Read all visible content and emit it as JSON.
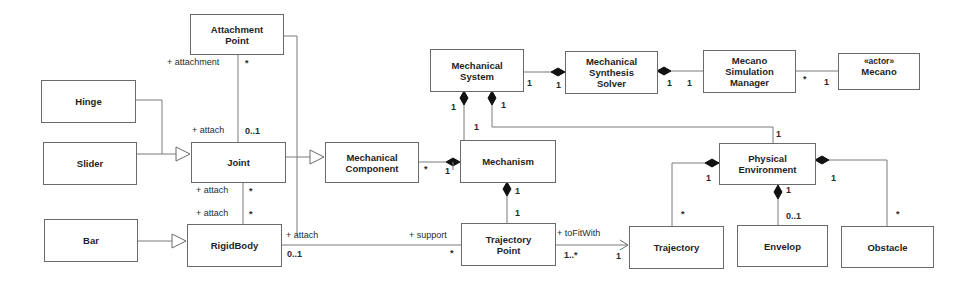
{
  "diagram": {
    "type": "UML class diagram",
    "classes": {
      "attachment_point": {
        "line1": "Attachment",
        "line2": "Point"
      },
      "hinge": {
        "name": "Hinge"
      },
      "slider": {
        "name": "Slider"
      },
      "joint": {
        "name": "Joint"
      },
      "bar": {
        "name": "Bar"
      },
      "rigid_body": {
        "name": "RigidBody"
      },
      "mechanical_component": {
        "line1": "Mechanical",
        "line2": "Component"
      },
      "mechanism": {
        "name": "Mechanism"
      },
      "mechanical_system": {
        "line1": "Mechanical",
        "line2": "System"
      },
      "synthesis_solver": {
        "line1": "Mechanical",
        "line2": "Synthesis",
        "line3": "Solver"
      },
      "simulation_manager": {
        "line1": "Mecano",
        "line2": "Simulation",
        "line3": "Manager"
      },
      "mecano_actor": {
        "stereotype": "«actor»",
        "name": "Mecano"
      },
      "trajectory_point": {
        "line1": "Trajectory",
        "line2": "Point"
      },
      "physical_environment": {
        "line1": "Physical",
        "line2": "Environment"
      },
      "trajectory": {
        "name": "Trajectory"
      },
      "envelop": {
        "name": "Envelop"
      },
      "obstacle": {
        "name": "Obstacle"
      }
    },
    "labels": {
      "ap_role_attachment": "+ attachment",
      "ap_mult_star": "*",
      "joint_role_attach_top": "+ attach",
      "joint_mult_top": "0..1",
      "joint_role_attach_bottom": "+ attach",
      "joint_mult_bottom": "*",
      "rb_role_attach_top": "+ attach",
      "rb_mult_top": "*",
      "rb_role_attach_right": "+ attach",
      "rb_mult_right": "0..1",
      "tp_role_support": "+ support",
      "tp_mult_support": "*",
      "mc_mult": "*",
      "mech_mult_comp": "1",
      "mech_mult_tp": "1",
      "tp_mult_mech": "1",
      "ms_mult_left_outer": "1",
      "ms_mult_right_diamond": "1",
      "mech_mult_ms": "1",
      "ms_mult_solver": "1",
      "solver_mult_ms": "1",
      "solver_mult_mgr": "1",
      "mgr_mult_solver": "1",
      "mgr_mult_actor": "*",
      "actor_mult_mgr": "1",
      "pe_mult_ms": "1",
      "pe_mult_traj": "1",
      "pe_mult_env": "1",
      "pe_mult_obs": "1",
      "traj_mult_pe": "*",
      "env_mult_pe": "0..1",
      "obs_mult_pe": "*",
      "tp_role_tofitwith": "+ toFitWith",
      "tp_mult_tofitwith": "1..*",
      "traj_mult_tp": "1"
    }
  }
}
